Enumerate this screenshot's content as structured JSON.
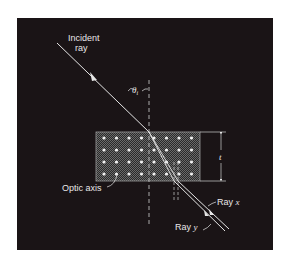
{
  "figure": {
    "background": "#1a1416",
    "page_background": "#ffffff",
    "line_color": "#e6e6e6",
    "labels": {
      "incident_line1": "Incident",
      "incident_line2": "ray",
      "theta": "θ",
      "theta_sub": "i",
      "thickness": "t",
      "optic_axis": "Optic axis",
      "ray_x_prefix": "Ray ",
      "ray_x_var": "x",
      "ray_y_prefix": "Ray ",
      "ray_y_var": "y"
    },
    "slab": {
      "dot_rows": 4,
      "dot_cols": 8,
      "dot_pattern": "optic axis perpendicular to page (dots)"
    }
  }
}
